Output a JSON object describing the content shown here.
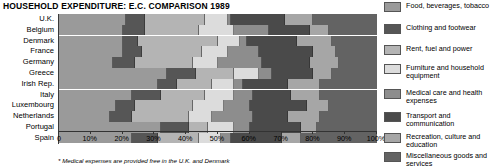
{
  "title": "HOUSEHOLD EXPENDITURE: E.C. COMPARISON  1989",
  "footnote": "* Medical expenses are provided free in the U.K. and Denmark",
  "axis": {
    "ticks": [
      "0",
      "10%",
      "20%",
      "30%",
      "40%",
      "50%",
      "60%",
      "70%",
      "80%",
      "90%",
      "100%"
    ],
    "tick_values": [
      0,
      10,
      20,
      30,
      40,
      50,
      60,
      70,
      80,
      90,
      100
    ]
  },
  "legend": {
    "items": [
      {
        "label": "Food, beverages, tobacco",
        "color": "#9a9a9a"
      },
      {
        "label": "Clothing and footwear",
        "color": "#565656"
      },
      {
        "label": "Rent, fuel and power",
        "color": "#b4b4b4"
      },
      {
        "label": "Furniture and household\nequipment",
        "color": "#dcdcdc"
      },
      {
        "label": "Medical care and health\nexpenses",
        "color": "#8d8d8d"
      },
      {
        "label": "Transport and\ncommunication",
        "color": "#4a4a4a"
      },
      {
        "label": "Recreation, culture and\neducation",
        "color": "#a6a6a6"
      },
      {
        "label": "Miscellaneous goods and\nservices",
        "color": "#636363"
      }
    ]
  },
  "chart_data": {
    "type": "bar",
    "orientation": "horizontal",
    "stacked": true,
    "stacked_normalized": true,
    "title": "HOUSEHOLD EXPENDITURE: E.C. COMPARISON  1989",
    "xlabel": "",
    "ylabel": "",
    "xlim": [
      0,
      100
    ],
    "grid": false,
    "legend_position": "right",
    "annotations": [
      "* Medical expenses are provided free in the U.K. and Denmark"
    ],
    "categories": [
      "U.K.",
      "Belgium",
      "Denmark",
      "France",
      "Germany",
      "Greece",
      "Irish Rep.",
      "Italy",
      "Luxembourg",
      "Netherlands",
      "Portugal",
      "Spain"
    ],
    "series": [
      {
        "name": "Food, beverages, tobacco",
        "color": "#9a9a9a",
        "values": [
          21,
          20,
          20,
          20,
          17,
          34,
          31,
          23,
          18,
          16,
          32,
          23
        ]
      },
      {
        "name": "Clothing and footwear",
        "color": "#565656",
        "values": [
          6,
          7,
          5,
          6,
          7,
          9,
          6,
          9,
          6,
          7,
          9,
          8
        ]
      },
      {
        "name": "Rent, fuel and power",
        "color": "#b4b4b4",
        "values": [
          19,
          17,
          25,
          19,
          18,
          12,
          11,
          14,
          18,
          18,
          6,
          13
        ]
      },
      {
        "name": "Furniture and household equipment",
        "color": "#dcdcdc",
        "values": [
          7,
          11,
          7,
          8,
          8,
          8,
          7,
          9,
          10,
          7,
          8,
          7
        ]
      },
      {
        "name": "Medical care and health expenses",
        "color": "#8d8d8d",
        "values": [
          1,
          11,
          2,
          10,
          14,
          4,
          3,
          6,
          8,
          13,
          5,
          3
        ]
      },
      {
        "name": "Transport and communication",
        "color": "#4a4a4a",
        "values": [
          17,
          13,
          16,
          17,
          15,
          13,
          14,
          12,
          18,
          11,
          16,
          16
        ]
      },
      {
        "name": "Recreation, culture and education",
        "color": "#a6a6a6",
        "values": [
          9,
          6,
          11,
          7,
          9,
          6,
          10,
          9,
          7,
          10,
          5,
          6
        ]
      },
      {
        "name": "Miscellaneous goods and services",
        "color": "#636363",
        "values": [
          20,
          15,
          14,
          13,
          12,
          14,
          18,
          18,
          15,
          18,
          19,
          24
        ]
      }
    ]
  }
}
